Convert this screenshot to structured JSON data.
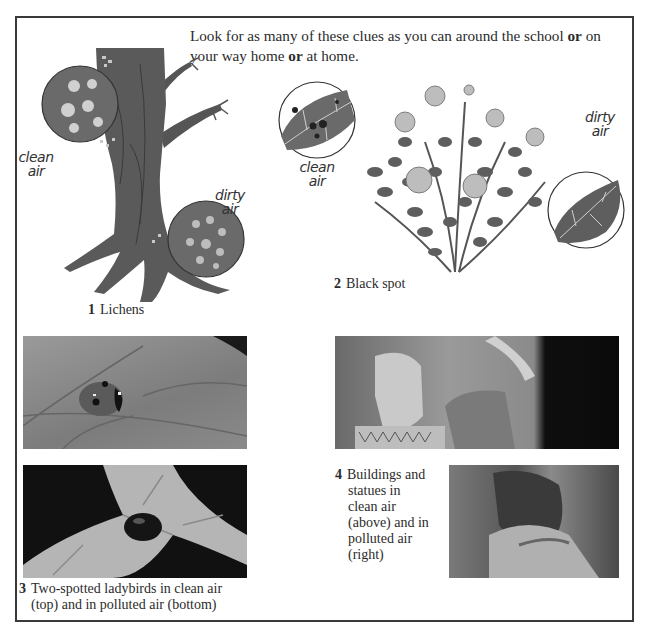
{
  "intro": {
    "part1": "Look for as many of these clues as you can around the school ",
    "bold1": "or",
    "part2": " on your way home ",
    "bold2": "or",
    "part3": " at home."
  },
  "figures": [
    {
      "number": "1",
      "caption": "Lichens",
      "labels": {
        "clean": [
          "clean",
          "air"
        ],
        "dirty": [
          "dirty",
          "air"
        ]
      },
      "icon": "tree-with-lichens-illustration"
    },
    {
      "number": "2",
      "caption": "Black spot",
      "labels": {
        "clean": [
          "clean",
          "air"
        ],
        "dirty": [
          "dirty",
          "air"
        ]
      },
      "icon": "rose-bush-illustration"
    },
    {
      "number": "3",
      "caption_line1": "Two-spotted ladybirds in clean air",
      "caption_line2": "(top) and in polluted air (bottom)",
      "photos": [
        "ladybird-clean-air-photo",
        "ladybird-polluted-air-photo"
      ]
    },
    {
      "number": "4",
      "caption_lines": [
        "Buildings and",
        "statues in",
        "clean air",
        "(above) and in",
        "polluted air",
        "(right)"
      ],
      "photos": [
        "statue-clean-air-photo",
        "statue-polluted-air-photo"
      ]
    }
  ]
}
